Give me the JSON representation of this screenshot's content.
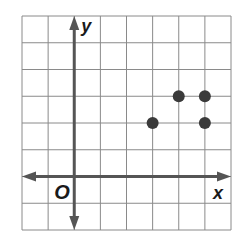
{
  "chart_data": {
    "type": "scatter",
    "title": "",
    "xlabel": "x",
    "ylabel": "y",
    "origin_label": "O",
    "grid": true,
    "xlim": [
      -2,
      6
    ],
    "ylim": [
      -2,
      6
    ],
    "points": [
      {
        "x": 3,
        "y": 2
      },
      {
        "x": 4,
        "y": 3
      },
      {
        "x": 5,
        "y": 3
      },
      {
        "x": 5,
        "y": 2
      }
    ]
  },
  "colors": {
    "grid": "#8a8a8a",
    "axis": "#555555",
    "point": "#3a3a3a"
  }
}
